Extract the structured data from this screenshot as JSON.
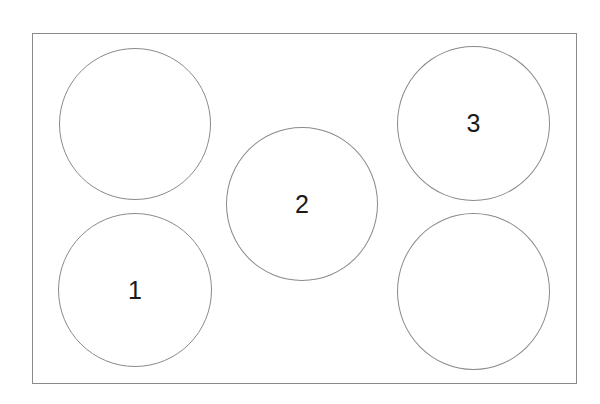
{
  "diagram": {
    "frame": {
      "border_color": "#8a8a8a"
    },
    "circles": [
      {
        "id": "top-left",
        "label": "",
        "cx": 135,
        "cy": 124,
        "r": 76
      },
      {
        "id": "bottom-left",
        "label": "1",
        "cx": 135,
        "cy": 290,
        "r": 77
      },
      {
        "id": "center",
        "label": "2",
        "cx": 302,
        "cy": 204,
        "r": 76
      },
      {
        "id": "top-right",
        "label": "3",
        "cx": 474,
        "cy": 124,
        "r": 76
      },
      {
        "id": "bottom-right",
        "label": "",
        "cx": 474,
        "cy": 292,
        "r": 77
      }
    ]
  }
}
